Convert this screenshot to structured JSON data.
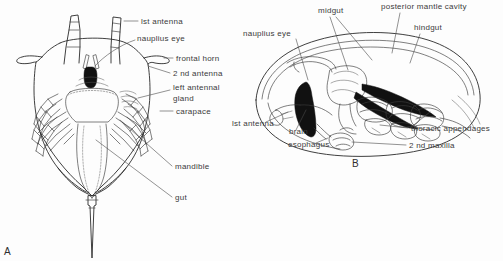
{
  "figure": {
    "background_color": "#fdfdfd",
    "ink_color": "#2a2a2a",
    "label_color": "#3b3b3b",
    "panels": [
      {
        "letter": "A",
        "name": "ventral-view",
        "letter_x": 4,
        "letter_y": 255,
        "labels": [
          {
            "id": "first-antenna",
            "text": "lst antenna",
            "x": 141,
            "y": 24,
            "anchor": "start"
          },
          {
            "id": "nauplius-eye",
            "text": "nauplius eye",
            "x": 137,
            "y": 41,
            "anchor": "start"
          },
          {
            "id": "frontal-horn",
            "text": "frontal horn",
            "x": 176,
            "y": 61,
            "anchor": "start"
          },
          {
            "id": "second-antenna",
            "text": "2 nd antenna",
            "x": 173,
            "y": 76,
            "anchor": "start"
          },
          {
            "id": "left-antennal",
            "text": "left antennal",
            "x": 173,
            "y": 90,
            "anchor": "start"
          },
          {
            "id": "gland",
            "text": "gland",
            "x": 173,
            "y": 101,
            "anchor": "start"
          },
          {
            "id": "carapace",
            "text": "carapace",
            "x": 176,
            "y": 114,
            "anchor": "start"
          },
          {
            "id": "mandible",
            "text": "mandible",
            "x": 175,
            "y": 169,
            "anchor": "start"
          },
          {
            "id": "gut",
            "text": "gut",
            "x": 175,
            "y": 200,
            "anchor": "start"
          }
        ]
      },
      {
        "letter": "B",
        "name": "lateral-view",
        "letter_x": 352,
        "letter_y": 167,
        "labels": [
          {
            "id": "midgut",
            "text": "midgut",
            "x": 318,
            "y": 13,
            "anchor": "start"
          },
          {
            "id": "posterior-mantle-cavity",
            "text": "posterior mantle cavity",
            "x": 381,
            "y": 9,
            "anchor": "start"
          },
          {
            "id": "hindgut",
            "text": "hindgut",
            "x": 414,
            "y": 30,
            "anchor": "start"
          },
          {
            "id": "nauplius-eye-b",
            "text": "nauplius eye",
            "x": 243,
            "y": 36,
            "anchor": "start"
          },
          {
            "id": "first-antenna-b",
            "text": "lst antenna",
            "x": 232,
            "y": 126,
            "anchor": "start"
          },
          {
            "id": "brain",
            "text": "brain",
            "x": 289,
            "y": 134,
            "anchor": "start"
          },
          {
            "id": "esophagus",
            "text": "esophagus",
            "x": 288,
            "y": 147,
            "anchor": "start"
          },
          {
            "id": "thoracic-appendages",
            "text": "thoracic appendages",
            "x": 411,
            "y": 131,
            "anchor": "start"
          },
          {
            "id": "second-maxilla",
            "text": "2 nd maxilla",
            "x": 409,
            "y": 148,
            "anchor": "start"
          }
        ]
      }
    ]
  }
}
